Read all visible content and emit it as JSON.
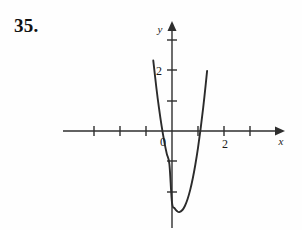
{
  "figure": {
    "problem_number": "35.",
    "background_color": "#fefefe",
    "ink_color": "#2b2b2b"
  },
  "labels": {
    "x_axis_label": "x",
    "y_axis_label": "y",
    "origin_label": "0",
    "x_tick_2_label": "2",
    "y_tick_2_label": "2"
  },
  "chart_data": {
    "type": "line",
    "title": "",
    "subtitle": "",
    "xlabel": "x",
    "ylabel": "y",
    "xlim": [
      -3.2,
      3.3
    ],
    "ylim": [
      -3.1,
      3.5
    ],
    "grid": false,
    "legend": null,
    "axes": {
      "x_ticks": [
        -3,
        -2,
        -1,
        1,
        2,
        3
      ],
      "x_tick_labels": [
        "",
        "",
        "",
        "",
        "2",
        ""
      ],
      "y_ticks": [
        -2,
        -1,
        1,
        2,
        3
      ],
      "y_tick_labels": [
        "",
        "",
        "",
        "2",
        ""
      ],
      "origin_label": "0",
      "x_arrow": true,
      "y_arrow": true,
      "tick_length_px": 5
    },
    "series": [
      {
        "name": "parabola",
        "shape": "upward-opening parabola",
        "equation": "y = 4x^2 - 2.2x - 2.35",
        "vertex": [
          0.28,
          -2.66
        ],
        "x_intercepts": [
          -0.53,
          1.08
        ],
        "y_intercept": -2.35,
        "x": [
          -0.72,
          -0.6,
          -0.5,
          -0.4,
          -0.3,
          -0.2,
          -0.1,
          0.0,
          0.1,
          0.2,
          0.28,
          0.4,
          0.5,
          0.6,
          0.7,
          0.8,
          0.9,
          1.0,
          1.1,
          1.2,
          1.3,
          1.35
        ],
        "y": [
          2.31,
          1.41,
          0.75,
          0.17,
          -0.33,
          -0.75,
          -1.09,
          -2.35,
          -2.53,
          -2.63,
          -2.66,
          -2.59,
          -2.45,
          -2.23,
          -1.93,
          -1.55,
          -1.09,
          -0.55,
          0.07,
          0.77,
          1.55,
          1.97
        ]
      }
    ]
  }
}
